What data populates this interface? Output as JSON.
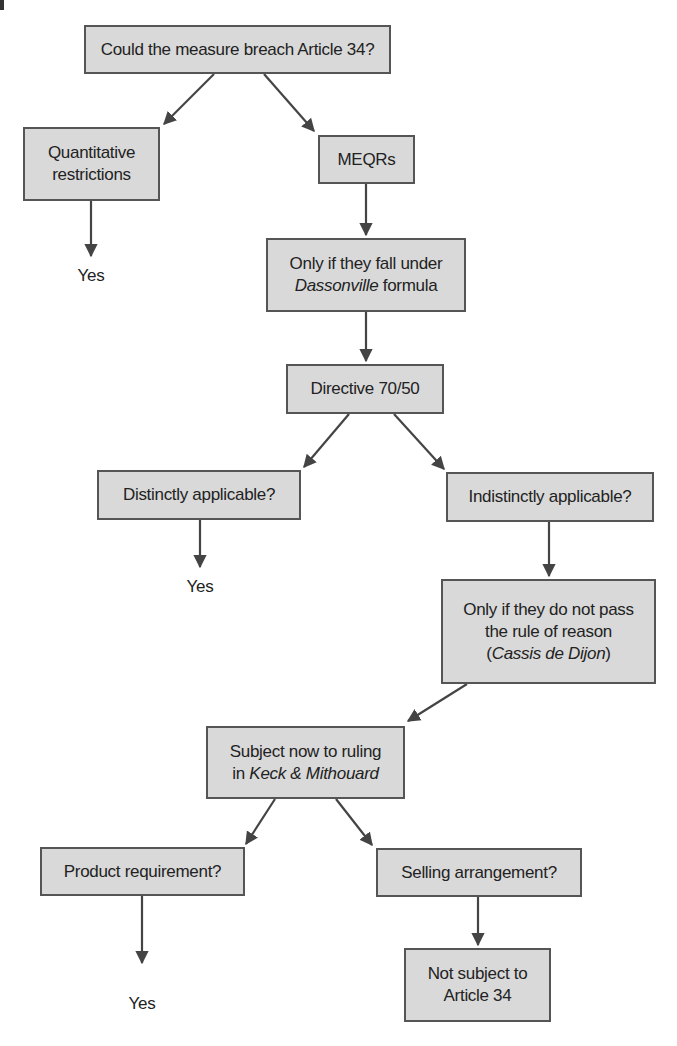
{
  "diagram": {
    "type": "flowchart",
    "colors": {
      "box_fill": "#d9d9d9",
      "box_border": "#555555",
      "text": "#222222",
      "arrow": "#444444"
    },
    "nodes": {
      "root": {
        "lines": [
          {
            "pre": "Could the measure breach Article 34?",
            "em": "",
            "post": ""
          }
        ]
      },
      "quantitative": {
        "lines": [
          {
            "pre": "Quantitative",
            "em": "",
            "post": ""
          },
          {
            "pre": "restrictions",
            "em": "",
            "post": ""
          }
        ]
      },
      "meqrs": {
        "lines": [
          {
            "pre": "MEQRs",
            "em": "",
            "post": ""
          }
        ]
      },
      "dassonville": {
        "lines": [
          {
            "pre": "Only if they fall under",
            "em": "",
            "post": ""
          },
          {
            "pre": "",
            "em": "Dassonville",
            "post": " formula"
          }
        ]
      },
      "directive": {
        "lines": [
          {
            "pre": "Directive 70/50",
            "em": "",
            "post": ""
          }
        ]
      },
      "distinct": {
        "lines": [
          {
            "pre": "Distinctly applicable?",
            "em": "",
            "post": ""
          }
        ]
      },
      "indistinct": {
        "lines": [
          {
            "pre": "Indistinctly applicable?",
            "em": "",
            "post": ""
          }
        ]
      },
      "cassis": {
        "lines": [
          {
            "pre": "Only if they do not pass",
            "em": "",
            "post": ""
          },
          {
            "pre": "the rule of reason",
            "em": "",
            "post": ""
          },
          {
            "pre": "(",
            "em": "Cassis de Dijon",
            "post": ")"
          }
        ]
      },
      "keck": {
        "lines": [
          {
            "pre": "Subject now to ruling",
            "em": "",
            "post": ""
          },
          {
            "pre": "in ",
            "em": "Keck & Mithouard",
            "post": ""
          }
        ]
      },
      "product": {
        "lines": [
          {
            "pre": "Product requirement?",
            "em": "",
            "post": ""
          }
        ]
      },
      "selling": {
        "lines": [
          {
            "pre": "Selling arrangement?",
            "em": "",
            "post": ""
          }
        ]
      },
      "not_subject": {
        "lines": [
          {
            "pre": "Not subject to",
            "em": "",
            "post": ""
          },
          {
            "pre": "Article 34",
            "em": "",
            "post": ""
          }
        ]
      }
    },
    "outcomes": {
      "yes_quantitative": "Yes",
      "yes_distinct": "Yes",
      "yes_product": "Yes"
    }
  }
}
